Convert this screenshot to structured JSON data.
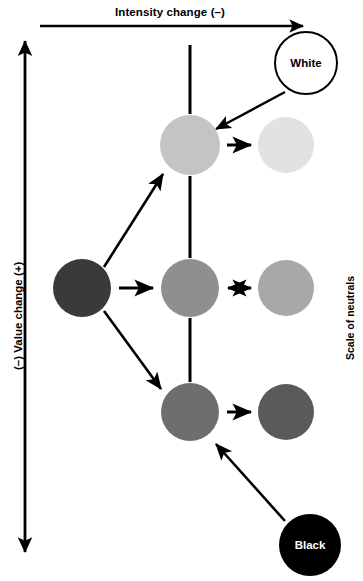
{
  "figure": {
    "width": 363,
    "height": 581,
    "background": "#ffffff"
  },
  "axes": {
    "top": {
      "label": "Intensity change (–)",
      "type": "single-headed-arrow",
      "direction": "left-to-right",
      "x1": 40,
      "x2": 308,
      "y": 26,
      "color": "#000000"
    },
    "left": {
      "label": "(–) Value change (+)",
      "type": "double-headed-arrow",
      "direction": "vertical",
      "x": 25,
      "y1": 35,
      "y2": 558,
      "color": "#000000"
    },
    "right": {
      "label": "Scale of neutrals",
      "type": "text-only",
      "color": "#000000"
    }
  },
  "spine": {
    "label": "central-vertical-line",
    "x": 190,
    "y1": 45,
    "y2": 400,
    "color": "#000000",
    "width": 3
  },
  "nodes": [
    {
      "id": "white",
      "label": "White",
      "fill": "#ffffff",
      "stroke": "#000000",
      "stroke_width": 2,
      "text_color": "#000000",
      "cx": 306,
      "cy": 63,
      "r": 31
    },
    {
      "id": "light-gray",
      "label": "",
      "fill": "#c4c4c4",
      "stroke": "none",
      "stroke_width": 0,
      "text_color": "#000000",
      "cx": 190,
      "cy": 145,
      "r": 30
    },
    {
      "id": "pale-gray",
      "label": "",
      "fill": "#e2e2e2",
      "stroke": "none",
      "stroke_width": 0,
      "text_color": "#000000",
      "cx": 286,
      "cy": 145,
      "r": 28
    },
    {
      "id": "dark-gray",
      "label": "",
      "fill": "#3a3a3a",
      "stroke": "none",
      "stroke_width": 0,
      "text_color": "#ffffff",
      "cx": 82,
      "cy": 288,
      "r": 29
    },
    {
      "id": "mid-gray",
      "label": "",
      "fill": "#8f8f8f",
      "stroke": "none",
      "stroke_width": 0,
      "text_color": "#000000",
      "cx": 190,
      "cy": 288,
      "r": 29
    },
    {
      "id": "mid-light-gray",
      "label": "",
      "fill": "#a8a8a8",
      "stroke": "none",
      "stroke_width": 0,
      "text_color": "#000000",
      "cx": 286,
      "cy": 288,
      "r": 28
    },
    {
      "id": "dark-mid-gray",
      "label": "",
      "fill": "#6e6e6e",
      "stroke": "none",
      "stroke_width": 0,
      "text_color": "#ffffff",
      "cx": 190,
      "cy": 412,
      "r": 29
    },
    {
      "id": "darker-gray",
      "label": "",
      "fill": "#5a5a5a",
      "stroke": "none",
      "stroke_width": 0,
      "text_color": "#ffffff",
      "cx": 286,
      "cy": 412,
      "r": 28
    },
    {
      "id": "black",
      "label": "Black",
      "fill": "#000000",
      "stroke": "none",
      "stroke_width": 0,
      "text_color": "#ffffff",
      "cx": 310,
      "cy": 545,
      "r": 31
    }
  ],
  "connectors": [
    {
      "id": "white-to-light-gray",
      "from": "white",
      "to": "light-gray",
      "heads": "single",
      "x1": 285,
      "y1": 92,
      "x2": 213,
      "y2": 131
    },
    {
      "id": "light-gray-to-pale-gray",
      "from": "light-gray",
      "to": "pale-gray",
      "heads": "single",
      "x1": 227,
      "y1": 145,
      "x2": 254,
      "y2": 145
    },
    {
      "id": "dark-gray-to-light-gray",
      "from": "dark-gray",
      "to": "light-gray",
      "heads": "single",
      "x1": 104,
      "y1": 267,
      "x2": 166,
      "y2": 170
    },
    {
      "id": "dark-gray-to-mid-gray",
      "from": "dark-gray",
      "to": "mid-gray",
      "heads": "single",
      "x1": 119,
      "y1": 288,
      "x2": 156,
      "y2": 288
    },
    {
      "id": "mid-gray-to-mid-light-gray",
      "from": "mid-gray",
      "to": "mid-light-gray",
      "heads": "double",
      "x1": 225,
      "y1": 288,
      "x2": 254,
      "y2": 288
    },
    {
      "id": "dark-gray-to-dark-mid-gray",
      "from": "dark-gray",
      "to": "dark-mid-gray",
      "heads": "single",
      "x1": 104,
      "y1": 311,
      "x2": 164,
      "y2": 392
    },
    {
      "id": "dark-mid-gray-to-darker-gray",
      "from": "dark-mid-gray",
      "to": "darker-gray",
      "heads": "single",
      "x1": 227,
      "y1": 412,
      "x2": 254,
      "y2": 412
    },
    {
      "id": "black-to-dark-mid-gray",
      "from": "black",
      "to": "dark-mid-gray",
      "heads": "single",
      "x1": 285,
      "y1": 521,
      "x2": 213,
      "y2": 441
    }
  ]
}
